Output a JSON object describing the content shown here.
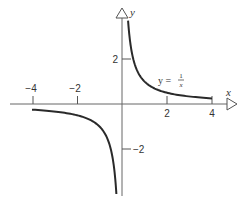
{
  "chart_data": {
    "type": "line",
    "title": "",
    "xlabel": "x",
    "ylabel": "y",
    "xlim": [
      -4.9,
      5.0
    ],
    "ylim": [
      -4.0,
      4.2
    ],
    "grid": false,
    "x_ticks": [
      -4,
      -2,
      2,
      4
    ],
    "y_ticks": [
      2,
      -2
    ],
    "x_tick_labels": [
      "−4",
      "−2",
      "2",
      "4"
    ],
    "y_tick_labels": [
      "2",
      "−2"
    ],
    "series": [
      {
        "name": "y = 1/x",
        "function": "1/x",
        "branches": [
          {
            "x_range": [
              0.27,
              4
            ]
          },
          {
            "x_range": [
              -4,
              -0.25
            ]
          }
        ]
      }
    ],
    "annotations": [
      {
        "text": "y = ",
        "fraction": {
          "num": "1",
          "den": "x"
        },
        "x": 1.6,
        "y": 1.1
      }
    ]
  },
  "labels": {
    "x_axis": "x",
    "y_axis": "y",
    "tick_x_m4": "−4",
    "tick_x_m2": "−2",
    "tick_x_2": "2",
    "tick_x_4": "4",
    "tick_y_2": "2",
    "tick_y_m2": "−2",
    "eq_prefix": "y = ",
    "eq_num": "1",
    "eq_den": "x"
  },
  "colors": {
    "axis": "#555555",
    "curve": "#2a2a2a",
    "text": "#333333"
  }
}
